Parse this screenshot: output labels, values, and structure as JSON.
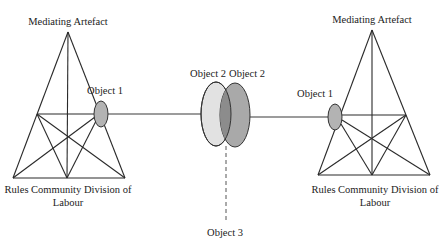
{
  "diagram": {
    "left_system": {
      "apex_label": "Mediating Artefact",
      "object_label": "Object 1",
      "base_label_line1": "Rules Community Division of",
      "base_label_line2": "Labour"
    },
    "right_system": {
      "apex_label": "Mediating Artefact",
      "object_label": "Object 1",
      "base_label_line1": "Rules Community Division of",
      "base_label_line2": "Labour"
    },
    "center": {
      "left_object_label": "Object 2",
      "right_object_label": "Object 2",
      "shared_object_label": "Object 3"
    },
    "colors": {
      "object1_fill": "#b3b3b3",
      "object2_left_fill": "#e2e2e2",
      "object2_right_fill": "#a9a9a9",
      "overlap_fill": "#8c8c8c",
      "line": "#2a2a2a"
    }
  }
}
